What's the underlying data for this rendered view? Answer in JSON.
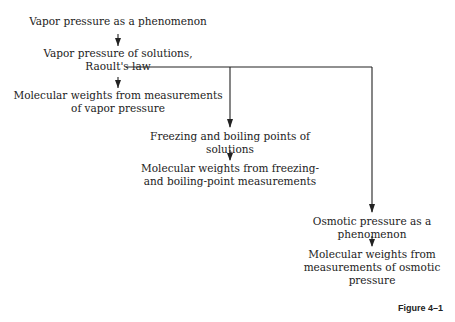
{
  "nodes": {
    "n1": [
      "Vapor pressure as a phenomenon"
    ],
    "n2": [
      "Vapor pressure of solutions,",
      "Raoult's law"
    ],
    "n3": [
      "Molecular weights from measurements",
      "of vapor pressure"
    ],
    "n4": [
      "Freezing and boiling points of",
      "solutions"
    ],
    "n5": [
      "Molecular weights from freezing-",
      "and boiling-point measurements"
    ],
    "n6": [
      "Osmotic pressure as a",
      "phenomenon"
    ],
    "n7": [
      "Molecular weights from",
      "measurements of osmotic",
      "pressure"
    ]
  },
  "caption": "Figure 4–1"
}
